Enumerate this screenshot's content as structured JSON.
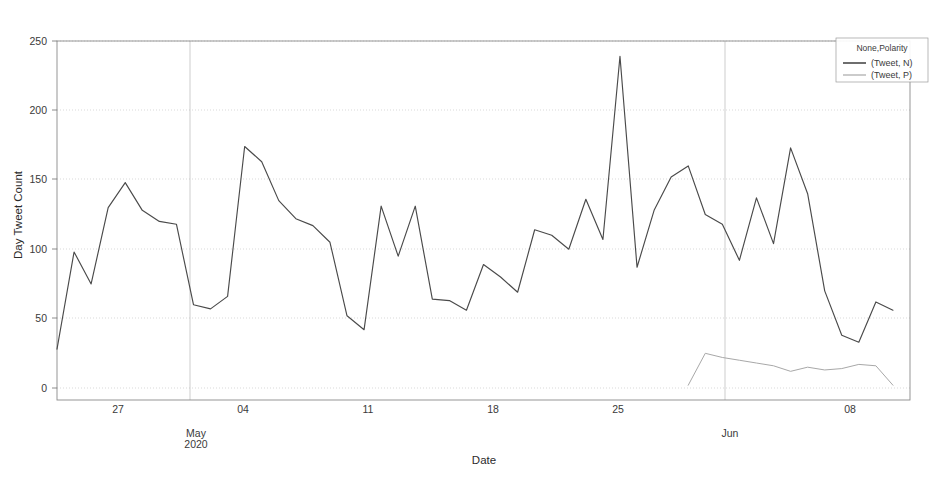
{
  "chart_data": {
    "type": "line",
    "title": "",
    "xlabel": "Date",
    "ylabel": "Day Tweet Count",
    "ylim": [
      0,
      250
    ],
    "yticks": [
      0,
      50,
      100,
      150,
      200,
      250
    ],
    "ytick_labels": [
      "0",
      "50",
      "100",
      "150",
      "200",
      "250"
    ],
    "xtick_labels": [
      "27",
      "04",
      "11",
      "18",
      "25",
      "08"
    ],
    "x_group_labels": [
      {
        "label": "May\n2020",
        "line1": "May",
        "line2": "2020"
      },
      {
        "label": "Jun",
        "line1": "Jun",
        "line2": ""
      }
    ],
    "grid": true,
    "legend_position": "upper right",
    "legend_title": "None,Polarity",
    "series": [
      {
        "name": "(Tweet, N)",
        "color": "#4a4a4a",
        "x": [
          "2020-04-24",
          "2020-04-25",
          "2020-04-26",
          "2020-04-27",
          "2020-04-28",
          "2020-04-29",
          "2020-04-30",
          "2020-05-01",
          "2020-05-02",
          "2020-05-03",
          "2020-05-04",
          "2020-05-05",
          "2020-05-06",
          "2020-05-07",
          "2020-05-08",
          "2020-05-09",
          "2020-05-10",
          "2020-05-11",
          "2020-05-12",
          "2020-05-13",
          "2020-05-14",
          "2020-05-15",
          "2020-05-16",
          "2020-05-17",
          "2020-05-18",
          "2020-05-19",
          "2020-05-20",
          "2020-05-21",
          "2020-05-22",
          "2020-05-23",
          "2020-05-24",
          "2020-05-25",
          "2020-05-26",
          "2020-05-27",
          "2020-05-28",
          "2020-05-29",
          "2020-05-30",
          "2020-05-31",
          "2020-06-01",
          "2020-06-02",
          "2020-06-03",
          "2020-06-04",
          "2020-06-05",
          "2020-06-06",
          "2020-06-07",
          "2020-06-08",
          "2020-06-09",
          "2020-06-10",
          "2020-06-11",
          "2020-06-12"
        ],
        "values": [
          28,
          98,
          75,
          130,
          148,
          128,
          120,
          118,
          60,
          57,
          66,
          174,
          163,
          135,
          122,
          117,
          105,
          52,
          42,
          131,
          95,
          131,
          64,
          63,
          56,
          89,
          80,
          69,
          114,
          110,
          100,
          136,
          107,
          239,
          87,
          128,
          152,
          160,
          125,
          118,
          92,
          137,
          104,
          173,
          140,
          70,
          38,
          33,
          62,
          56
        ]
      },
      {
        "name": "(Tweet, P)",
        "color": "#a8a8a8",
        "x": [
          "2020-05-31",
          "2020-06-01",
          "2020-06-02",
          "2020-06-03",
          "2020-06-04",
          "2020-06-05",
          "2020-06-06",
          "2020-06-07",
          "2020-06-08",
          "2020-06-09",
          "2020-06-10",
          "2020-06-11",
          "2020-06-12"
        ],
        "values": [
          2,
          25,
          22,
          20,
          18,
          16,
          12,
          15,
          13,
          14,
          17,
          16,
          2
        ]
      }
    ],
    "axis_ranges": {
      "x_start": "2020-04-24",
      "x_end": "2020-06-13"
    }
  },
  "legend": {
    "title": "None,Polarity",
    "entries": [
      {
        "label": "(Tweet, N)",
        "color": "#4a4a4a"
      },
      {
        "label": "(Tweet, P)",
        "color": "#a8a8a8"
      }
    ]
  },
  "axes": {
    "y_title": "Day Tweet Count",
    "x_title": "Date",
    "y_ticks": [
      "250",
      "200",
      "150",
      "100",
      "50",
      "0"
    ],
    "x_ticks": [
      "27",
      "04",
      "11",
      "18",
      "25",
      "08"
    ],
    "x_groups": [
      "May",
      "2020",
      "Jun"
    ]
  }
}
